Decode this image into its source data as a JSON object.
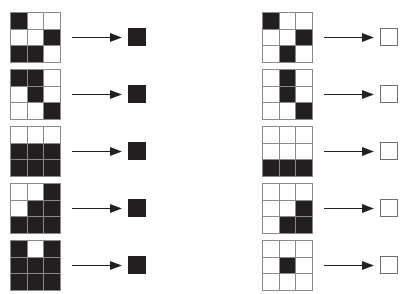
{
  "figure": {
    "title": "",
    "cell_colors": {
      "on": "#231f20",
      "off": "#ffffff",
      "grid_line": "#8a8a8a"
    },
    "arrow_label": "implies",
    "columns": [
      {
        "name": "left-column",
        "result_type": "filled",
        "rows": [
          {
            "name": "row-1",
            "grid": [
              [
                1,
                0,
                0
              ],
              [
                0,
                0,
                1
              ],
              [
                1,
                1,
                0
              ]
            ],
            "result": "filled"
          },
          {
            "name": "row-2",
            "grid": [
              [
                1,
                1,
                0
              ],
              [
                0,
                1,
                0
              ],
              [
                0,
                0,
                1
              ]
            ],
            "result": "filled"
          },
          {
            "name": "row-3",
            "grid": [
              [
                0,
                0,
                0
              ],
              [
                1,
                1,
                1
              ],
              [
                1,
                1,
                1
              ]
            ],
            "result": "filled"
          },
          {
            "name": "row-4",
            "grid": [
              [
                0,
                0,
                1
              ],
              [
                0,
                1,
                1
              ],
              [
                1,
                1,
                1
              ]
            ],
            "result": "filled"
          },
          {
            "name": "row-5",
            "grid": [
              [
                1,
                0,
                1
              ],
              [
                1,
                1,
                1
              ],
              [
                1,
                1,
                1
              ]
            ],
            "result": "filled"
          }
        ]
      },
      {
        "name": "right-column",
        "result_type": "empty",
        "rows": [
          {
            "name": "row-1",
            "grid": [
              [
                1,
                0,
                0
              ],
              [
                0,
                0,
                1
              ],
              [
                0,
                1,
                0
              ]
            ],
            "result": "empty"
          },
          {
            "name": "row-2",
            "grid": [
              [
                0,
                1,
                0
              ],
              [
                0,
                1,
                0
              ],
              [
                0,
                0,
                1
              ]
            ],
            "result": "empty"
          },
          {
            "name": "row-3",
            "grid": [
              [
                0,
                0,
                0
              ],
              [
                0,
                0,
                0
              ],
              [
                1,
                1,
                1
              ]
            ],
            "result": "empty"
          },
          {
            "name": "row-4",
            "grid": [
              [
                0,
                0,
                0
              ],
              [
                0,
                0,
                1
              ],
              [
                0,
                1,
                1
              ]
            ],
            "result": "empty"
          },
          {
            "name": "row-5",
            "grid": [
              [
                0,
                0,
                0
              ],
              [
                0,
                1,
                0
              ],
              [
                0,
                0,
                0
              ]
            ],
            "result": "empty"
          }
        ]
      }
    ],
    "row_tops": [
      9,
      66,
      123,
      180,
      237
    ]
  }
}
